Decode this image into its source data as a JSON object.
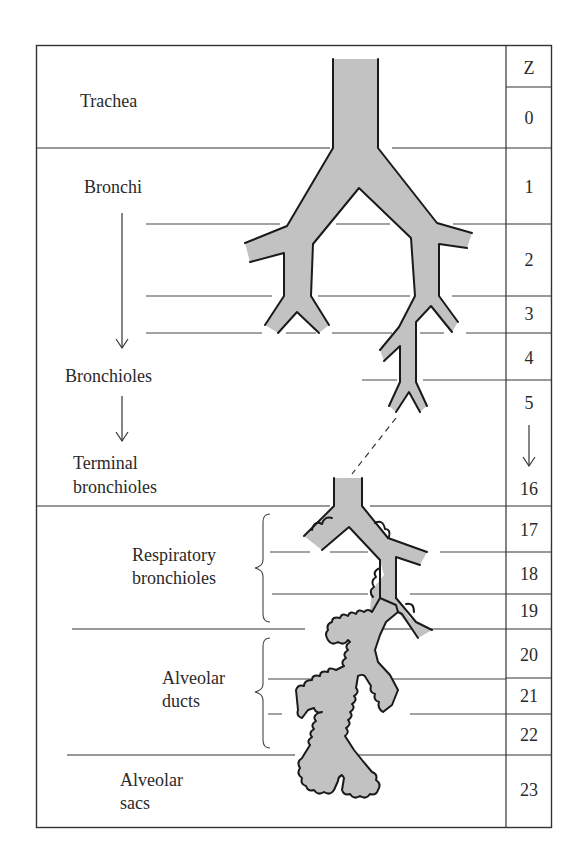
{
  "diagram": {
    "column_header": "Z",
    "zones": [
      {
        "label": "Trachea",
        "z": [
          "0"
        ]
      },
      {
        "label": "Bronchi",
        "z": [
          "1",
          "2",
          "3",
          "4"
        ]
      },
      {
        "label": "Bronchioles",
        "z": [
          "5"
        ]
      },
      {
        "label": "Terminal bronchioles",
        "z": [
          "16"
        ]
      },
      {
        "label": "Respiratory bronchioles",
        "z": [
          "17",
          "18",
          "19"
        ]
      },
      {
        "label": "Alveolar ducts",
        "z": [
          "20",
          "21",
          "22"
        ]
      },
      {
        "label": "Alveolar sacs",
        "z": [
          "23"
        ]
      }
    ],
    "labels": {
      "trachea": "Trachea",
      "bronchi": "Bronchi",
      "bronchioles": "Bronchioles",
      "terminal_line1": "Terminal",
      "terminal_line2": "bronchioles",
      "respiratory_line1": "Respiratory",
      "respiratory_line2": "bronchioles",
      "ducts_line1": "Alveolar",
      "ducts_line2": "ducts",
      "sacs_line1": "Alveolar",
      "sacs_line2": "sacs"
    },
    "z_column": {
      "header": "Z",
      "values": [
        "0",
        "1",
        "2",
        "3",
        "4",
        "5",
        "16",
        "17",
        "18",
        "19",
        "20",
        "21",
        "22",
        "23"
      ],
      "skip_arrow": "↓"
    },
    "colors": {
      "airway_fill": "#c2c2c2",
      "outline": "#1a1a1a",
      "rules": "#333333",
      "background": "#ffffff"
    }
  }
}
